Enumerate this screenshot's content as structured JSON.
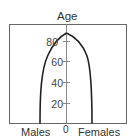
{
  "diagram": {
    "axis_title": "Age",
    "x_left_label": "Males",
    "x_right_label": "Females",
    "x_center_label": "0",
    "y_ticks": [
      {
        "label": "80",
        "value": 80
      },
      {
        "label": "60",
        "value": 60
      },
      {
        "label": "40",
        "value": 40
      },
      {
        "label": "20",
        "value": 20
      }
    ],
    "shape": "population pyramid (column/bullet shape)",
    "colors": {
      "line": "#222222",
      "frame": "#555555",
      "axis": "#777777"
    }
  }
}
